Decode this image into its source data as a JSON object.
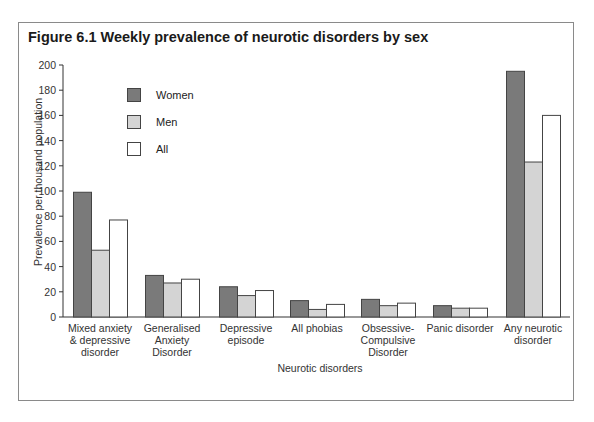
{
  "chart_data": {
    "type": "bar",
    "title": "Figure 6.1  Weekly prevalence of neurotic disorders by sex",
    "xlabel": "Neurotic disorders",
    "ylabel": "Prevalence per thousand population",
    "ylim": [
      0,
      200
    ],
    "yticks": [
      0,
      20,
      40,
      60,
      80,
      100,
      120,
      140,
      160,
      180,
      200
    ],
    "grid": false,
    "legend_position": "upper-left inside plot",
    "categories": [
      "Mixed anxiety & depressive disorder",
      "Generalised Anxiety Disorder",
      "Depressive episode",
      "All phobias",
      "Obsessive-Compulsive Disorder",
      "Panic disorder",
      "Any neurotic disorder"
    ],
    "category_lines": [
      [
        "Mixed anxiety",
        "& depressive",
        "disorder"
      ],
      [
        "Generalised",
        "Anxiety",
        "Disorder"
      ],
      [
        "Depressive",
        "episode"
      ],
      [
        "All phobias"
      ],
      [
        "Obsessive-",
        "Compulsive",
        "Disorder"
      ],
      [
        "Panic disorder"
      ],
      [
        "Any neurotic",
        "disorder"
      ]
    ],
    "series": [
      {
        "name": "Women",
        "color": "#7a7a7a",
        "values": [
          99,
          33,
          24,
          13,
          14,
          9,
          195
        ]
      },
      {
        "name": "Men",
        "color": "#d4d4d4",
        "values": [
          53,
          27,
          17,
          6,
          9,
          7,
          123
        ]
      },
      {
        "name": "All",
        "color": "#ffffff",
        "values": [
          77,
          30,
          21,
          10,
          11,
          7,
          160
        ]
      }
    ]
  },
  "legend": {
    "women": "Women",
    "men": "Men",
    "all": "All"
  },
  "colors": {
    "women": "#7a7a7a",
    "men": "#d4d4d4",
    "all": "#ffffff",
    "frame": "#8a8a8a",
    "axis": "#333333"
  }
}
